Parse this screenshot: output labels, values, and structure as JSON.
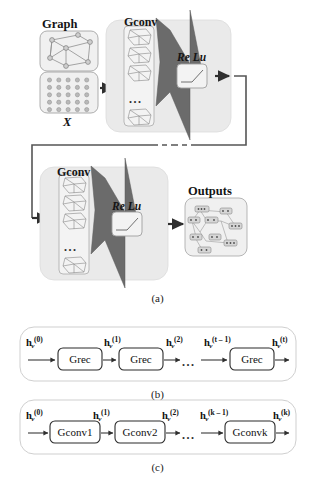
{
  "figure": {
    "title_parts": [
      "(a)",
      "(b)",
      "(c)"
    ],
    "panel_a": {
      "caption": "(a)",
      "input_group": {
        "graph_label": "Graph",
        "matrix_label": "X",
        "graph_icon": "graph-cube-icon",
        "matrix_icon": "feature-matrix-icon",
        "matrix_rows": 5,
        "matrix_cols": 5
      },
      "block1": {
        "title": "Gconv",
        "stack_icon": "graph-stack-icon",
        "stack_items": 3,
        "stack_ellipsis": "...",
        "funnel_icon": "aggregation-funnel-icon",
        "activation_label": "Re Lu",
        "activation_icon": "relu-curve-icon"
      },
      "block2": {
        "title": "Gconv",
        "stack_icon": "graph-stack-icon",
        "stack_items": 3,
        "stack_ellipsis": "...",
        "funnel_icon": "aggregation-funnel-icon",
        "activation_label": "Re Lu",
        "activation_icon": "relu-curve-icon"
      },
      "output_group": {
        "label": "Outputs",
        "icon": "output-graph-icon"
      },
      "skip_connection": {
        "icon": "dashed-feedback-connector-icon",
        "style": "dashed-middle"
      },
      "arrow_icon": "right-arrow-icon"
    },
    "panel_b": {
      "caption": "(b)",
      "arrow_icon": "right-arrow-icon",
      "ellipsis": "...",
      "nodes": [
        {
          "label": "Grec"
        },
        {
          "label": "Grec"
        },
        {
          "label": "Grec"
        }
      ],
      "edge_labels": [
        {
          "base": "h",
          "sub": "v",
          "sup": "(0)"
        },
        {
          "base": "h",
          "sub": "v",
          "sup": "(1)"
        },
        {
          "base": "h",
          "sub": "v",
          "sup": "(2)"
        },
        {
          "base": "h",
          "sub": "v",
          "sup": "(t – 1)"
        },
        {
          "base": "h",
          "sub": "v",
          "sup": "(t)"
        }
      ]
    },
    "panel_c": {
      "caption": "(c)",
      "arrow_icon": "right-arrow-icon",
      "ellipsis": "...",
      "nodes": [
        {
          "label": "Gconv1"
        },
        {
          "label": "Gconv2"
        },
        {
          "label": "Gconvk"
        }
      ],
      "edge_labels": [
        {
          "base": "h",
          "sub": "v",
          "sup": "(0)"
        },
        {
          "base": "h",
          "sub": "v",
          "sup": "(1)"
        },
        {
          "base": "h",
          "sub": "v",
          "sup": "(2)"
        },
        {
          "base": "h",
          "sub": "v",
          "sup": "(k – 1)"
        },
        {
          "base": "h",
          "sub": "v",
          "sup": "(k)"
        }
      ]
    },
    "colors": {
      "panel_fill": "#ececec",
      "card_fill": "#f2f2f2",
      "funnel_fill": "#676767",
      "stroke": "#6f6f6f",
      "arrow": "#2f2f2f",
      "text": "#141414",
      "background": "#ffffff"
    }
  }
}
